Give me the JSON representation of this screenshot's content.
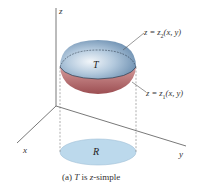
{
  "figure": {
    "axes": {
      "z": "z",
      "x": "x",
      "y": "y"
    },
    "solid_label": "T",
    "region_label": "R",
    "upper_surface": {
      "prefix": "z = z",
      "sub": "2",
      "args": "(x, y)"
    },
    "lower_surface": {
      "prefix": "z = z",
      "sub": "1",
      "args": "(x, y)"
    },
    "caption": {
      "tag": "(a) ",
      "var": "T",
      "rest": " is ",
      "var2": "z",
      "rest2": "-simple"
    },
    "colors": {
      "upper_surface": "#7d9fc0",
      "lower_surface": "#b96a6a",
      "region_fill": "#bcd9ec",
      "axis": "#555555"
    }
  }
}
